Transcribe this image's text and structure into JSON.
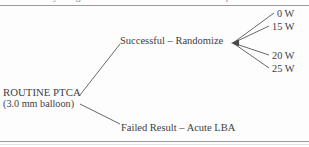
{
  "figure": {
    "caption_clipped": "Table 1. Study design of randomized and non-randomized patients",
    "type": "flow-diagram"
  },
  "diagram": {
    "root": {
      "line1": "ROUTINE PTCA",
      "line2": "(3.0 mm balloon)"
    },
    "branches": [
      {
        "label": "Successful – Randomize"
      },
      {
        "label": "Failed Result – Acute LBA"
      }
    ],
    "randomize_arms": [
      {
        "label": "0 W"
      },
      {
        "label": "15 W"
      },
      {
        "label": "20 W"
      },
      {
        "label": "25 W"
      }
    ]
  },
  "colors": {
    "ink": "#3f3f3f",
    "rule": "#9a9a9a",
    "paper": "#fdfdfd"
  }
}
